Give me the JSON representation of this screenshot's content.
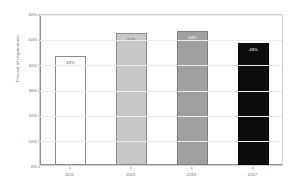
{
  "chart_data": {
    "type": "bar",
    "title": "",
    "xlabel": "",
    "ylabel": "Percent of respondents",
    "categories": [
      "2011",
      "2013",
      "2015",
      "2017"
    ],
    "values": [
      43,
      52,
      53,
      48
    ],
    "data_labels": [
      "43%",
      "52%",
      "53%",
      "48%"
    ],
    "ylim": [
      0,
      60
    ],
    "yticks": [
      0,
      10,
      20,
      30,
      40,
      50,
      60
    ],
    "ytick_labels": [
      "0%",
      "10%",
      "20%",
      "30%",
      "40%",
      "50%",
      "60%"
    ],
    "grid": true,
    "legend": "none",
    "bar_colors": [
      "#ffffff",
      "#c8c8c8",
      "#a0a0a0",
      "#0d0d0d"
    ],
    "bar_edge_colors": [
      "#8a8a8a",
      "#8a8a8a",
      "#7a7a7a",
      "#000000"
    ],
    "label_text_colors": [
      "#555555",
      "#555555",
      "#ffffff",
      "#ffffff"
    ]
  }
}
